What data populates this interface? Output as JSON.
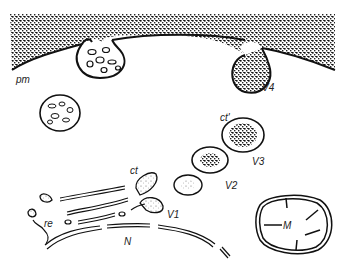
{
  "diagram": {
    "labels": {
      "pm": "pm",
      "ct_prime": "ct'",
      "v4": "V4",
      "v3": "V3",
      "v2": "V2",
      "v1": "V1",
      "ct": "ct",
      "re": "re",
      "n": "N",
      "m": "M"
    }
  }
}
